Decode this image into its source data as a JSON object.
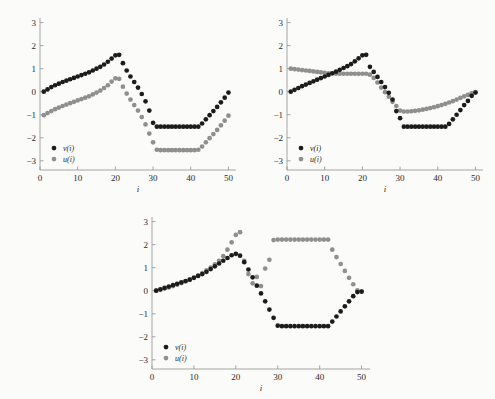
{
  "page": {
    "background": "#fbfbfa",
    "width": 495,
    "height": 399
  },
  "colors": {
    "series_v": "#1c1c1c",
    "series_u": "#8f8f8f",
    "axis": "#9a9a9a",
    "text": "#2a2a2a"
  },
  "chart_data": [
    {
      "id": "chart-top-left",
      "type": "scatter",
      "title": "",
      "xlabel": "i",
      "ylabel": "",
      "xlim": [
        0,
        52
      ],
      "ylim": [
        -3.4,
        3.2
      ],
      "xticks": [
        0,
        10,
        20,
        30,
        40,
        50
      ],
      "yticks": [
        -3,
        -2,
        -1,
        0,
        1,
        2,
        3
      ],
      "grid": false,
      "legend_position": "lower-left",
      "legend": [
        "v(i)",
        "u(i)"
      ],
      "series": [
        {
          "name": "v(i)",
          "color": "#1c1c1c",
          "x": [
            1,
            2,
            3,
            4,
            5,
            6,
            7,
            8,
            9,
            10,
            11,
            12,
            13,
            14,
            15,
            16,
            17,
            18,
            19,
            20,
            21,
            22,
            23,
            24,
            25,
            26,
            27,
            28,
            29,
            30,
            31,
            32,
            33,
            34,
            35,
            36,
            37,
            38,
            39,
            40,
            41,
            42,
            43,
            44,
            45,
            46,
            47,
            48,
            49,
            50
          ],
          "y": [
            0.0,
            0.1,
            0.2,
            0.28,
            0.35,
            0.42,
            0.48,
            0.54,
            0.6,
            0.66,
            0.72,
            0.78,
            0.84,
            0.92,
            1.0,
            1.08,
            1.18,
            1.3,
            1.44,
            1.58,
            1.6,
            1.24,
            0.92,
            0.66,
            0.42,
            0.18,
            -0.1,
            -0.42,
            -0.82,
            -1.35,
            -1.52,
            -1.52,
            -1.52,
            -1.52,
            -1.52,
            -1.52,
            -1.52,
            -1.52,
            -1.52,
            -1.52,
            -1.52,
            -1.52,
            -1.38,
            -1.2,
            -1.02,
            -0.84,
            -0.66,
            -0.46,
            -0.26,
            -0.04
          ]
        },
        {
          "name": "u(i)",
          "color": "#8f8f8f",
          "x": [
            1,
            2,
            3,
            4,
            5,
            6,
            7,
            8,
            9,
            10,
            11,
            12,
            13,
            14,
            15,
            16,
            17,
            18,
            19,
            20,
            21,
            22,
            23,
            24,
            25,
            26,
            27,
            28,
            29,
            30,
            31,
            32,
            33,
            34,
            35,
            36,
            37,
            38,
            39,
            40,
            41,
            42,
            43,
            44,
            45,
            46,
            47,
            48,
            49,
            50
          ],
          "y": [
            -1.02,
            -0.93,
            -0.84,
            -0.76,
            -0.69,
            -0.62,
            -0.56,
            -0.5,
            -0.44,
            -0.38,
            -0.32,
            -0.26,
            -0.2,
            -0.12,
            -0.04,
            0.05,
            0.16,
            0.28,
            0.44,
            0.58,
            0.56,
            0.22,
            -0.08,
            -0.34,
            -0.58,
            -0.82,
            -1.1,
            -1.42,
            -1.82,
            -2.2,
            -2.52,
            -2.54,
            -2.54,
            -2.54,
            -2.54,
            -2.54,
            -2.54,
            -2.54,
            -2.54,
            -2.54,
            -2.54,
            -2.52,
            -2.38,
            -2.2,
            -2.02,
            -1.84,
            -1.66,
            -1.46,
            -1.26,
            -1.04
          ]
        }
      ]
    },
    {
      "id": "chart-top-right",
      "type": "scatter",
      "title": "",
      "xlabel": "i",
      "ylabel": "",
      "xlim": [
        0,
        52
      ],
      "ylim": [
        -3.4,
        3.2
      ],
      "xticks": [
        0,
        10,
        20,
        30,
        40,
        50
      ],
      "yticks": [
        -3,
        -2,
        -1,
        0,
        1,
        2,
        3
      ],
      "grid": false,
      "legend_position": "lower-left",
      "legend": [
        "v(i)",
        "u(i)"
      ],
      "series": [
        {
          "name": "v(i)",
          "color": "#1c1c1c",
          "x": [
            1,
            2,
            3,
            4,
            5,
            6,
            7,
            8,
            9,
            10,
            11,
            12,
            13,
            14,
            15,
            16,
            17,
            18,
            19,
            20,
            21,
            22,
            23,
            24,
            25,
            26,
            27,
            28,
            29,
            30,
            31,
            32,
            33,
            34,
            35,
            36,
            37,
            38,
            39,
            40,
            41,
            42,
            43,
            44,
            45,
            46,
            47,
            48,
            49,
            50
          ],
          "y": [
            0.0,
            0.08,
            0.16,
            0.24,
            0.31,
            0.38,
            0.45,
            0.52,
            0.59,
            0.66,
            0.73,
            0.8,
            0.87,
            0.95,
            1.03,
            1.11,
            1.2,
            1.32,
            1.45,
            1.58,
            1.6,
            1.08,
            0.86,
            0.64,
            0.42,
            0.2,
            -0.05,
            -0.34,
            -0.84,
            -1.15,
            -1.52,
            -1.52,
            -1.52,
            -1.52,
            -1.52,
            -1.52,
            -1.52,
            -1.52,
            -1.52,
            -1.52,
            -1.52,
            -1.52,
            -1.4,
            -1.2,
            -1.0,
            -0.8,
            -0.58,
            -0.4,
            -0.18,
            -0.04
          ]
        },
        {
          "name": "u(i)",
          "color": "#8f8f8f",
          "x": [
            1,
            2,
            3,
            4,
            5,
            6,
            7,
            8,
            9,
            10,
            11,
            12,
            13,
            14,
            15,
            16,
            17,
            18,
            19,
            20,
            21,
            22,
            23,
            24,
            25,
            26,
            27,
            28,
            29,
            30,
            31,
            32,
            33,
            34,
            35,
            36,
            37,
            38,
            39,
            40,
            41,
            42,
            43,
            44,
            45,
            46,
            47,
            48,
            49,
            50
          ],
          "y": [
            1.0,
            0.98,
            0.96,
            0.94,
            0.92,
            0.9,
            0.88,
            0.86,
            0.84,
            0.82,
            0.8,
            0.79,
            0.78,
            0.78,
            0.78,
            0.78,
            0.78,
            0.78,
            0.78,
            0.78,
            0.78,
            0.74,
            0.6,
            0.4,
            0.18,
            -0.02,
            -0.22,
            -0.44,
            -0.62,
            -0.82,
            -0.86,
            -0.86,
            -0.85,
            -0.83,
            -0.81,
            -0.78,
            -0.75,
            -0.71,
            -0.67,
            -0.63,
            -0.58,
            -0.53,
            -0.47,
            -0.41,
            -0.34,
            -0.27,
            -0.2,
            -0.14,
            -0.07,
            -0.02
          ]
        }
      ]
    },
    {
      "id": "chart-bottom",
      "type": "scatter",
      "title": "",
      "xlabel": "i",
      "ylabel": "",
      "xlim": [
        0,
        52
      ],
      "ylim": [
        -3.4,
        3.2
      ],
      "xticks": [
        0,
        10,
        20,
        30,
        40,
        50
      ],
      "yticks": [
        -3,
        -2,
        -1,
        0,
        1,
        2,
        3
      ],
      "grid": false,
      "legend_position": "lower-left",
      "legend": [
        "v(i)",
        "u(i)"
      ],
      "series": [
        {
          "name": "v(i)",
          "color": "#1c1c1c",
          "x": [
            1,
            2,
            3,
            4,
            5,
            6,
            7,
            8,
            9,
            10,
            11,
            12,
            13,
            14,
            15,
            16,
            17,
            18,
            19,
            20,
            21,
            22,
            23,
            24,
            25,
            26,
            27,
            28,
            29,
            30,
            31,
            32,
            33,
            34,
            35,
            36,
            37,
            38,
            39,
            40,
            41,
            42,
            43,
            44,
            45,
            46,
            47,
            48,
            49,
            50
          ],
          "y": [
            0.0,
            0.06,
            0.12,
            0.18,
            0.24,
            0.3,
            0.36,
            0.42,
            0.48,
            0.56,
            0.64,
            0.72,
            0.82,
            0.94,
            1.06,
            1.18,
            1.3,
            1.42,
            1.54,
            1.6,
            1.52,
            1.24,
            0.92,
            0.58,
            0.22,
            -0.12,
            -0.46,
            -0.82,
            -1.18,
            -1.52,
            -1.54,
            -1.54,
            -1.54,
            -1.54,
            -1.54,
            -1.54,
            -1.54,
            -1.54,
            -1.54,
            -1.54,
            -1.54,
            -1.54,
            -1.34,
            -1.12,
            -0.9,
            -0.68,
            -0.46,
            -0.24,
            -0.06,
            -0.04
          ]
        },
        {
          "name": "u(i)",
          "color": "#8f8f8f",
          "x": [
            1,
            2,
            3,
            4,
            5,
            6,
            7,
            8,
            9,
            10,
            11,
            12,
            13,
            14,
            15,
            16,
            17,
            18,
            19,
            20,
            21,
            22,
            23,
            24,
            25,
            26,
            27,
            28,
            29,
            30,
            31,
            32,
            33,
            34,
            35,
            36,
            37,
            38,
            39,
            40,
            41,
            42,
            43,
            44,
            45,
            46,
            47,
            48,
            49,
            50
          ],
          "y": [
            0.0,
            0.04,
            0.09,
            0.14,
            0.2,
            0.26,
            0.33,
            0.4,
            0.48,
            0.57,
            0.66,
            0.76,
            0.88,
            1.0,
            1.14,
            1.3,
            1.5,
            1.78,
            2.1,
            2.42,
            2.54,
            1.3,
            0.72,
            0.32,
            0.6,
            0.2,
            0.96,
            1.34,
            2.2,
            2.22,
            2.22,
            2.22,
            2.22,
            2.22,
            2.22,
            2.22,
            2.22,
            2.22,
            2.22,
            2.22,
            2.22,
            2.22,
            1.78,
            1.46,
            1.16,
            0.86,
            0.56,
            0.28,
            0.02,
            -0.04
          ]
        }
      ]
    }
  ]
}
